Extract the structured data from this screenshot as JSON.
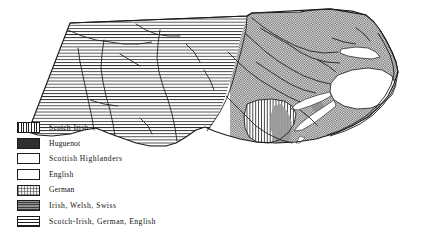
{
  "map": {
    "title": "Ethnic settlement regions of North Carolina",
    "region_names": [
      "Scotch-Irish, German, English (Piedmont / West)",
      "English (Coastal Plain / East)",
      "Scotch-Irish (South Central)",
      "Scottish Highlanders (Cape Fear Valley)"
    ],
    "water_label": "Pamlico Sound",
    "outer_banks_label": "Outer Banks"
  },
  "legend": {
    "items": [
      {
        "label": "Scotch-Irish",
        "pattern": "vertical-lines",
        "swatch_name": "swatch-scotch-irish"
      },
      {
        "label": "Huguenot",
        "pattern": "solid-dark",
        "swatch_name": "swatch-huguenot"
      },
      {
        "label": "Scottish  Highlanders",
        "pattern": "coarse-checker",
        "swatch_name": "swatch-scottish-highlanders"
      },
      {
        "label": "English",
        "pattern": "fine-checker",
        "swatch_name": "swatch-english"
      },
      {
        "label": "German",
        "pattern": "light-stipple",
        "swatch_name": "swatch-german"
      },
      {
        "label": "Irish,  Welsh,  Swiss",
        "pattern": "mid-gray-stipple",
        "swatch_name": "swatch-irish-welsh-swiss"
      },
      {
        "label": "Scotch-Irish,  German,  English",
        "pattern": "horizontal-lines",
        "swatch_name": "swatch-scotch-irish-german-english"
      }
    ]
  },
  "colors": {
    "ink": "#1b1b1b",
    "paper": "#ffffff",
    "highland_gray": "#9a9a9a",
    "huguenot_dark": "#2f2f2f"
  }
}
